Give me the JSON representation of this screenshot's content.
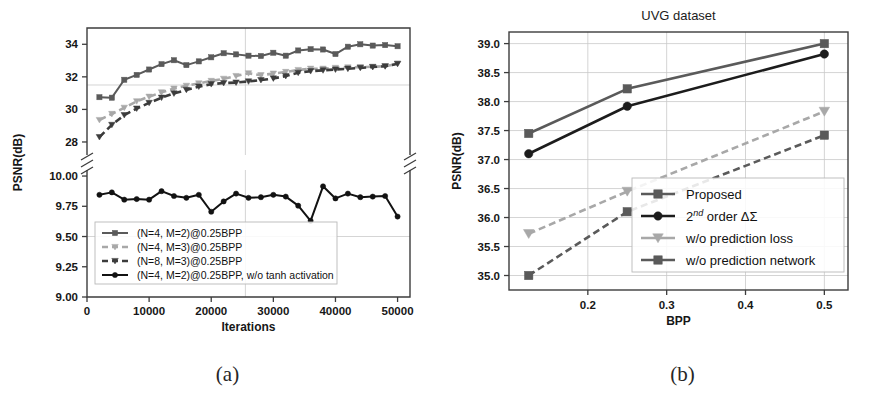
{
  "figure": {
    "panel_a_caption": "(a)",
    "panel_b_caption": "(b)"
  },
  "colors": {
    "dark_gray": "#4d4d4d",
    "mid_gray": "#8a8a8a",
    "light_gray": "#a8a8a8",
    "black": "#121212",
    "grid": "#c9c9c9",
    "axis": "#3d3d3d"
  },
  "chart_data": [
    {
      "id": "panel-a",
      "type": "line",
      "title": "",
      "xlabel": "Iterations",
      "ylabel": "PSNR(dB)",
      "xlim": [
        0,
        52000
      ],
      "xticks": [
        0,
        10000,
        20000,
        30000,
        40000,
        50000
      ],
      "xticklabels": [
        "0",
        "10000",
        "20000",
        "30000",
        "40000",
        "50000"
      ],
      "broken_y_axis": true,
      "y_upper": {
        "ylim": [
          27.2,
          35.0
        ],
        "yticks": [
          28,
          30,
          32,
          34
        ],
        "yticklabels": [
          "28",
          "30",
          "32",
          "34"
        ]
      },
      "y_lower": {
        "ylim": [
          9.0,
          10.05
        ],
        "yticks": [
          9.0,
          9.25,
          9.5,
          9.75,
          10.0
        ],
        "yticklabels": [
          "9.00",
          "9.25",
          "9.50",
          "9.75",
          "10.00"
        ]
      },
      "grid": true,
      "legend_position": "lower-left",
      "series": [
        {
          "name": "(N=4, M=2)@0.25BPP",
          "color": "#5a5a5a",
          "marker": "square",
          "linestyle": "solid",
          "axis": "upper",
          "x": [
            2000,
            4000,
            6000,
            8000,
            10000,
            12000,
            14000,
            16000,
            18000,
            20000,
            22000,
            24000,
            26000,
            28000,
            30000,
            32000,
            34000,
            36000,
            38000,
            40000,
            42000,
            44000,
            46000,
            48000,
            50000
          ],
          "y": [
            30.75,
            30.72,
            31.82,
            32.12,
            32.45,
            32.78,
            33.02,
            32.72,
            32.95,
            33.2,
            33.45,
            33.38,
            33.3,
            33.28,
            33.48,
            33.3,
            33.62,
            33.7,
            33.68,
            33.4,
            33.85,
            34.0,
            33.92,
            33.95,
            33.88
          ]
        },
        {
          "name": "(N=4, M=3)@0.25BPP",
          "color": "#a8a8a8",
          "marker": "triangle-down",
          "linestyle": "dashed",
          "axis": "upper",
          "x": [
            2000,
            4000,
            6000,
            8000,
            10000,
            12000,
            14000,
            16000,
            18000,
            20000,
            22000,
            24000,
            26000,
            28000,
            30000,
            32000,
            34000,
            36000,
            38000,
            40000,
            42000,
            44000,
            46000,
            48000,
            50000
          ],
          "y": [
            29.35,
            29.72,
            30.1,
            30.5,
            30.78,
            31.05,
            31.28,
            31.45,
            31.6,
            31.75,
            31.88,
            32.05,
            32.22,
            32.1,
            32.2,
            32.3,
            32.42,
            32.5,
            32.5,
            32.55,
            32.58,
            32.6,
            32.62,
            32.65,
            32.8
          ]
        },
        {
          "name": "(N=8, M=3)@0.25BPP",
          "color": "#3c3c3c",
          "marker": "triangle-down",
          "linestyle": "dashed",
          "axis": "upper",
          "x": [
            2000,
            4000,
            6000,
            8000,
            10000,
            12000,
            14000,
            16000,
            18000,
            20000,
            22000,
            24000,
            26000,
            28000,
            30000,
            32000,
            34000,
            36000,
            38000,
            40000,
            42000,
            44000,
            46000,
            48000,
            50000
          ],
          "y": [
            28.3,
            29.05,
            29.65,
            30.05,
            30.4,
            30.72,
            30.98,
            31.2,
            31.4,
            31.55,
            31.62,
            31.65,
            31.72,
            31.8,
            31.9,
            32.05,
            32.25,
            32.35,
            32.4,
            32.45,
            32.5,
            32.55,
            32.6,
            32.65,
            32.8
          ]
        },
        {
          "name": "(N=4, M=2)@0.25BPP, w/o tanh activation",
          "color": "#121212",
          "marker": "circle",
          "linestyle": "solid",
          "axis": "lower",
          "x": [
            2000,
            4000,
            6000,
            8000,
            10000,
            12000,
            14000,
            16000,
            18000,
            20000,
            22000,
            24000,
            26000,
            28000,
            30000,
            32000,
            34000,
            36000,
            38000,
            40000,
            42000,
            44000,
            46000,
            48000,
            50000
          ],
          "y": [
            9.845,
            9.865,
            9.805,
            9.81,
            9.805,
            9.875,
            9.835,
            9.82,
            9.845,
            9.705,
            9.79,
            9.855,
            9.82,
            9.825,
            9.845,
            9.83,
            9.755,
            9.63,
            9.915,
            9.815,
            9.855,
            9.825,
            9.83,
            9.835,
            9.665
          ]
        }
      ]
    },
    {
      "id": "panel-b",
      "type": "line",
      "title": "UVG dataset",
      "xlabel": "BPP",
      "ylabel": "PSNR(dB)",
      "xlim": [
        0.1,
        0.53
      ],
      "xticks": [
        0.2,
        0.3,
        0.4,
        0.5
      ],
      "xticklabels": [
        "0.2",
        "0.3",
        "0.4",
        "0.5"
      ],
      "ylim": [
        34.75,
        39.2
      ],
      "yticks": [
        35.0,
        35.5,
        36.0,
        36.5,
        37.0,
        37.5,
        38.0,
        38.5,
        39.0
      ],
      "yticklabels": [
        "35.0",
        "35.5",
        "36.0",
        "36.5",
        "37.0",
        "37.5",
        "38.0",
        "38.5",
        "39.0"
      ],
      "grid": true,
      "legend_position": "lower-right",
      "series": [
        {
          "name": "Proposed",
          "color": "#5a5a5a",
          "marker": "square",
          "linestyle": "solid",
          "x": [
            0.125,
            0.25,
            0.5
          ],
          "y": [
            37.45,
            38.22,
            39.0
          ]
        },
        {
          "name": "2nd order ΔΣ",
          "label_rich": "2^{nd} order ΔΣ",
          "color": "#1c1c1c",
          "marker": "circle",
          "linestyle": "solid",
          "x": [
            0.125,
            0.25,
            0.5
          ],
          "y": [
            37.1,
            37.92,
            38.82
          ]
        },
        {
          "name": "w/o prediction loss",
          "color": "#a8a8a8",
          "marker": "triangle-down",
          "linestyle": "dashed",
          "x": [
            0.125,
            0.25,
            0.5
          ],
          "y": [
            35.72,
            36.45,
            37.83
          ]
        },
        {
          "name": "w/o prediction network",
          "color": "#5a5a5a",
          "marker": "square",
          "linestyle": "dashed",
          "x": [
            0.125,
            0.25,
            0.5
          ],
          "y": [
            35.0,
            36.1,
            37.42
          ]
        }
      ]
    }
  ]
}
